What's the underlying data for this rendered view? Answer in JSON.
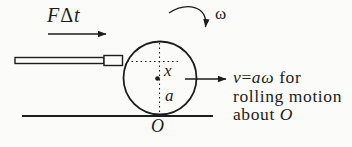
{
  "colors": {
    "paper": "#fbfbf9",
    "ink": "#1d1d1d"
  },
  "labels": {
    "impulse_F": "F",
    "impulse_delta": "Δ",
    "impulse_t": "t",
    "omega": "ω",
    "strike_offset": "x",
    "radius": "a",
    "contact_point": "O"
  },
  "annotation": {
    "v": "v",
    "equals": "=",
    "a_omega": "aω",
    "for_word": " for",
    "line2": "rolling motion",
    "about_word": "about ",
    "about_O": "O"
  }
}
